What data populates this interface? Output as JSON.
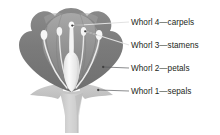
{
  "figure": {
    "background_color": "#ffffff"
  },
  "labels": [
    {
      "id": "whorl4",
      "text": "Whorl 4—carpels",
      "whorl_number": "4",
      "organ": "carpels",
      "points_to": "carpel-stigma"
    },
    {
      "id": "whorl3",
      "text": "Whorl 3—stamens",
      "whorl_number": "3",
      "organ": "stamens",
      "points_to": "stamen-anther-right"
    },
    {
      "id": "whorl2",
      "text": "Whorl 2—petals",
      "whorl_number": "2",
      "organ": "petals",
      "points_to": "petal-outer-edge"
    },
    {
      "id": "whorl1",
      "text": "Whorl 1—sepals",
      "whorl_number": "1",
      "organ": "sepals",
      "points_to": "sepal-edge"
    }
  ],
  "diagram": {
    "parts": [
      {
        "name": "petals",
        "fill": "#7c7c7c"
      },
      {
        "name": "petal-inner-shade",
        "fill": "#999999"
      },
      {
        "name": "petal-top-highlight",
        "fill": "#a6a6a6"
      },
      {
        "name": "sepals",
        "fill": "#c3c3c3"
      },
      {
        "name": "receptacle-stem",
        "fill": "#cfcfcf"
      },
      {
        "name": "carpel",
        "fill": "#f2f2f2"
      },
      {
        "name": "stamen-filament",
        "fill": "#ededed"
      },
      {
        "name": "stamen-anther",
        "fill": "#f7f7f7"
      }
    ],
    "leader_line_color": "#d8d8d8",
    "leader_line_color_dark": "#58595b",
    "marker_color": "#58595b"
  }
}
